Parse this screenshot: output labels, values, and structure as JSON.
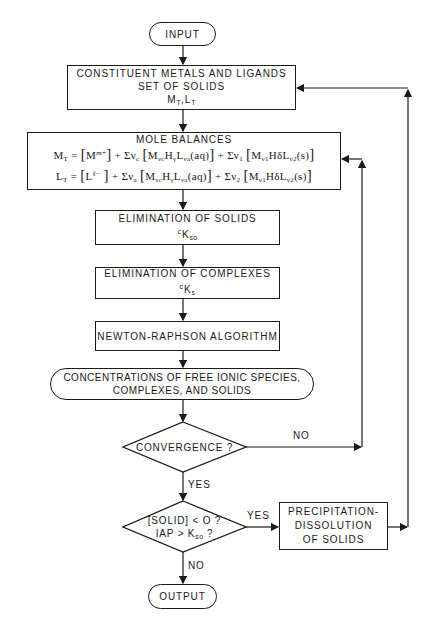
{
  "nodes": {
    "input": {
      "label": "INPUT"
    },
    "constituents": {
      "line1": "CONSTITUENT METALS AND LIGANDS",
      "line2": "SET OF SOLIDS",
      "line3_main1": "M",
      "line3_sub1": "T",
      "line3_sep": ",L",
      "line3_sub2": "T"
    },
    "mole_balances": {
      "title": "MOLE BALANCES",
      "eq1": "M_T = [M^(m+)] + Σν_c [M_νc H_γ L_νa (aq)] + Σν_1 [M_ν1 H_δ L_ν2 (s)]",
      "eq2": "L_T = [L^(ℓ−)] + Σν_a [M_νc H_γ L_νa (aq)] + Σν_2 [M_ν1 H_δ L_ν2 (s)]"
    },
    "elim_solids": {
      "label": "ELIMINATION OF SOLIDS",
      "constant_pre": "c",
      "constant": "K",
      "constant_sub": "so"
    },
    "elim_complexes": {
      "label": "ELIMINATION OF COMPLEXES",
      "constant_pre": "c",
      "constant": "K",
      "constant_sub": "s"
    },
    "newton": {
      "label": "NEWTON-RAPHSON ALGORITHM"
    },
    "concentrations": {
      "line1": "CONCENTRATIONS OF FREE IONIC SPECIES,",
      "line2": "COMPLEXES, AND SOLIDS"
    },
    "convergence": {
      "label": "CONVERGENCE ?"
    },
    "solid_check": {
      "line1": "[SOLID] < O ?",
      "line2_main": "IAP > K",
      "line2_sub": "so",
      "line2_end": " ?"
    },
    "precipitation": {
      "line1": "PRECIPITATION-",
      "line2": "DISSOLUTION",
      "line3": "OF SOLIDS"
    },
    "output": {
      "label": "OUTPUT"
    }
  },
  "edge_labels": {
    "convergence_no": "NO",
    "convergence_yes": "YES",
    "solid_yes": "YES",
    "solid_no": "NO"
  },
  "colors": {
    "stroke": "#1a1a1a",
    "background": "#ffffff"
  }
}
